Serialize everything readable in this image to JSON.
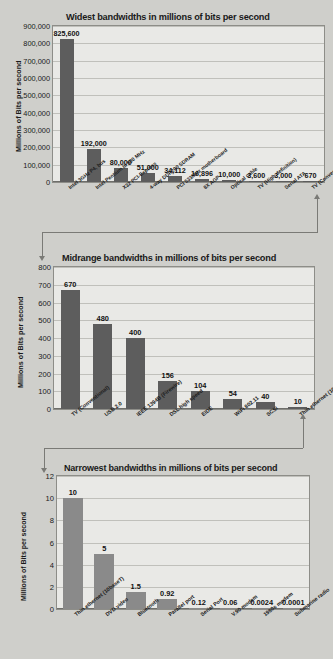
{
  "chart_data": [
    {
      "type": "bar",
      "title": "Widest bandwidths in millions of bits per second",
      "xlabel": "",
      "ylabel": "Millions of  Bits per second",
      "ylim": [
        0,
        900000
      ],
      "yticks": [
        "0",
        "100,000",
        "200,000",
        "300,000",
        "400,000",
        "500,000",
        "600,000",
        "700,000",
        "800,000",
        "900,000"
      ],
      "grid": true,
      "legend": "none",
      "bar_color": "#5d5d5d",
      "categories": [
        "Intel 3GHz P4, bus",
        "Intel Pentium III  500 MHz",
        "X32 PCI-Express",
        "4-way DDR200 SDRAM",
        "PCI 533MHz  motherboard",
        "8X AGP",
        "Optical cable",
        "TV (High definition)",
        "Serial ATA",
        "TV (Conventional)"
      ],
      "values": [
        825600,
        192000,
        80000,
        51000,
        34112,
        16896,
        10000,
        3600,
        3000,
        670
      ],
      "labels": [
        "825,600",
        "192,000",
        "80,000",
        "51,000",
        "34,112",
        "16,896",
        "10,000",
        "3,600",
        "3,000",
        "670"
      ]
    },
    {
      "type": "bar",
      "title": "Midrange bandwidths in millions of bits per second",
      "xlabel": "",
      "ylabel": "Millions of  Bits per second",
      "ylim": [
        0,
        800
      ],
      "yticks": [
        "0",
        "100",
        "200",
        "300",
        "400",
        "500",
        "600",
        "700",
        "800"
      ],
      "grid": true,
      "legend": "none",
      "bar_color": "#5d5d5d",
      "categories": [
        "TV (Conventional)",
        "USB 2.0",
        "IEEE 1394B (Firewire)",
        "DSL high speed",
        "EIDE",
        "WiFi 802.11",
        "SCSI",
        "Thin ethernet (10baseT)"
      ],
      "values": [
        670,
        480,
        400,
        156,
        104,
        54,
        40,
        10
      ],
      "labels": [
        "670",
        "480",
        "400",
        "156",
        "104",
        "54",
        "40",
        "10"
      ]
    },
    {
      "type": "bar",
      "title": "Narrowest bandwidths in millions of bits per second",
      "xlabel": "",
      "ylabel": "Millions of  Bits per second",
      "ylim": [
        0,
        12
      ],
      "yticks": [
        "0",
        "2",
        "4",
        "6",
        "8",
        "10",
        "12"
      ],
      "grid": true,
      "legend": "none",
      "bar_color": "#8a8a8a",
      "categories": [
        "Thin ethernet (10baseT)",
        "DVD video",
        "Bluetooth",
        "Parallel port",
        "Serial Port",
        "V.90 modem",
        "1980s modem",
        "Submarine radio"
      ],
      "values": [
        10,
        5,
        1.5,
        0.92,
        0.12,
        0.06,
        0.0024,
        0.0001
      ],
      "labels": [
        "10",
        "5",
        "1.5",
        "0.92",
        "0.12",
        "0.06",
        "0.0024",
        "0.0001"
      ]
    }
  ]
}
